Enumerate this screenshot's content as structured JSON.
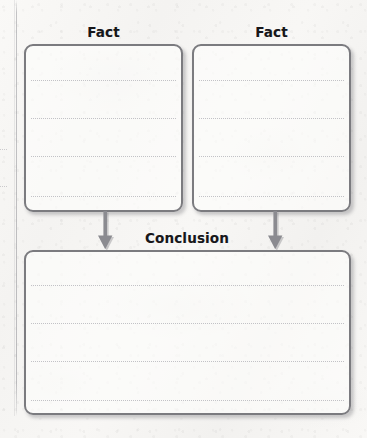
{
  "worksheet": {
    "type": "graphic-organizer",
    "layout": "two-facts-to-one-conclusion",
    "boxes": [
      {
        "id": "fact-1",
        "label": "Fact",
        "rule_lines": 4,
        "writing_area": true
      },
      {
        "id": "fact-2",
        "label": "Fact",
        "rule_lines": 4,
        "writing_area": true
      },
      {
        "id": "conclusion",
        "label": "Conclusion",
        "rule_lines": 4,
        "writing_area": true
      }
    ],
    "connectors": [
      {
        "id": "arrow-left",
        "icon": "arrow-down-icon",
        "from": "fact-1",
        "to": "conclusion"
      },
      {
        "id": "arrow-right",
        "icon": "arrow-down-icon",
        "from": "fact-2",
        "to": "conclusion"
      }
    ],
    "colors": {
      "paper": "#f7f6f4",
      "box_border": "#7b7b7f",
      "rule_line": "#c2c2c6",
      "label_text": "#17171a",
      "arrow_fill": "#8b8b90",
      "margin_rule": "#96969b"
    }
  }
}
